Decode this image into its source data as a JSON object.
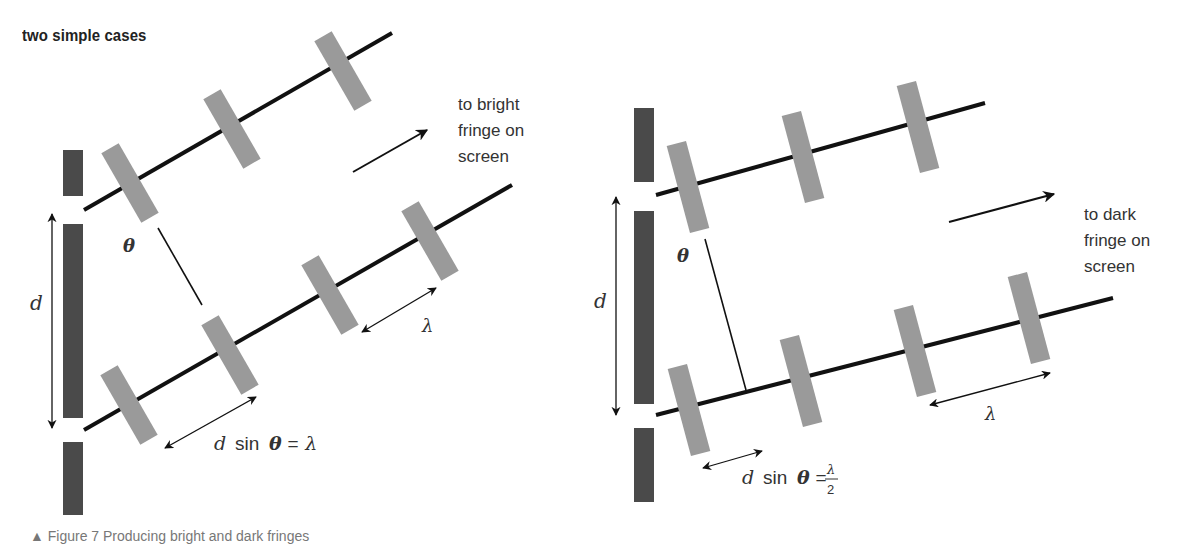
{
  "title": "two simple cases",
  "caption": "▲ Figure 7 Producing bright and dark fringes",
  "colors": {
    "barrier": "#4a4a4a",
    "wavefront": "#9a9a9a",
    "ray": "#111111",
    "text": "#333333"
  },
  "left_diagram": {
    "case": "bright",
    "direction_label_lines": [
      "to bright",
      "fringe on",
      "screen"
    ],
    "slit_separation_label": "d",
    "angle_label": "θ",
    "wavelength_label": "λ",
    "path_difference_label": "d sin θ = λ",
    "path_difference_parts": {
      "lhs": "d",
      "func": "sin",
      "angle": "θ",
      "eq": "=",
      "rhs": "λ"
    }
  },
  "right_diagram": {
    "case": "dark",
    "direction_label_lines": [
      "to dark",
      "fringe on",
      "screen"
    ],
    "slit_separation_label": "d",
    "angle_label": "θ",
    "wavelength_label": "λ",
    "path_difference_label": "d sin θ = λ/2",
    "path_difference_parts": {
      "lhs": "d",
      "func": "sin",
      "angle": "θ",
      "eq": "=",
      "num": "λ",
      "den": "2"
    }
  }
}
